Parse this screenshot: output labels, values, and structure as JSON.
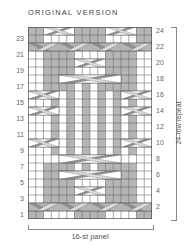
{
  "title": "ORIGINAL VERSION",
  "left_row_numbers": [
    "23",
    "21",
    "19",
    "17",
    "15",
    "13",
    "11",
    "9",
    "7",
    "5",
    "3",
    "1"
  ],
  "right_row_numbers": [
    "24",
    "22",
    "20",
    "18",
    "16",
    "14",
    "12",
    "10",
    "8",
    "6",
    "4",
    "2"
  ],
  "repeat_label": "24-row repeat",
  "panel_label": "16-st panel",
  "colors": {
    "purl": "#b5b5b5",
    "knit": "#ffffff",
    "grid": "#555555",
    "cable_dark": "#8f8f8f",
    "cable_light": "#dcdcdc"
  },
  "chart_data": {
    "type": "table",
    "title": "ORIGINAL VERSION",
    "columns": 16,
    "rows": 24,
    "xlabel": "16-st panel",
    "ylabel": "24-row repeat",
    "legend": {
      "g": "gray (purl)",
      "w": "white (knit)"
    },
    "grid_rows_bottom_to_top": [
      "ggwwwwggggwwwwgg",
      "gggggggggggggggg",
      "wwggggwwwwggggww",
      "wwggggwwwwggggww",
      "wwggggwwwwggggww",
      "wwggggwgwgggggww",
      "wwggggwgwgggggww",
      "wwwwwwwwwwwwwwww",
      "wwwgwgwgwgwgwgww",
      "gwwgwgwgwgwgwwwg",
      "wwwgwgwgwgwgwgww",
      "wwwgwgwgwgwgwgww",
      "wwwgwgwgwgwgwgww",
      "gwwgwgwgwgwgwwwg",
      "wwwgwgwgwgwgwgww",
      "wwwgwgwgwgwgwgww",
      "wwggggwgwgggggww",
      "wwggggwgwgggggww",
      "wwggggwwwwggggww",
      "wwggggwwwwggggww",
      "wwggggwwwwggggww",
      "gggggggggggggggg",
      "ggwwwwggggwwwwgg",
      "ggggwwggggwwgggg"
    ],
    "cables": [
      {
        "row": 2,
        "type": "band-cross",
        "cols": [
          1,
          16
        ]
      },
      {
        "row": 4,
        "type": "cross",
        "cols": [
          7,
          10
        ]
      },
      {
        "row": 6,
        "type": "cross",
        "cols": [
          5,
          12
        ]
      },
      {
        "row": 8,
        "type": "cross",
        "cols": [
          5,
          12
        ]
      },
      {
        "row": 10,
        "type": "cross",
        "cols": [
          1,
          4
        ]
      },
      {
        "row": 10,
        "type": "cross",
        "cols": [
          13,
          16
        ]
      },
      {
        "row": 14,
        "type": "cross",
        "cols": [
          1,
          4
        ]
      },
      {
        "row": 14,
        "type": "cross",
        "cols": [
          13,
          16
        ]
      },
      {
        "row": 16,
        "type": "cross",
        "cols": [
          1,
          4
        ]
      },
      {
        "row": 16,
        "type": "cross",
        "cols": [
          13,
          16
        ]
      },
      {
        "row": 18,
        "type": "cross",
        "cols": [
          5,
          12
        ]
      },
      {
        "row": 20,
        "type": "cross",
        "cols": [
          7,
          10
        ]
      },
      {
        "row": 22,
        "type": "band-cross",
        "cols": [
          1,
          16
        ]
      },
      {
        "row": 24,
        "type": "cross",
        "cols": [
          3,
          6
        ]
      },
      {
        "row": 24,
        "type": "cross",
        "cols": [
          11,
          14
        ]
      }
    ]
  }
}
